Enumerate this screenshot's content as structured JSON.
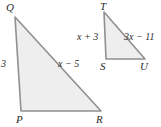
{
  "figure": {
    "background_color": "#ffffff",
    "shape_fill_color": "#eeeeee",
    "shape_stroke_color": "#909090",
    "text_color": "#2b2b2b",
    "triangles": [
      {
        "name": "triangle-QPR",
        "vertices": [
          {
            "label": "Q",
            "x": 15,
            "y": 17
          },
          {
            "label": "P",
            "x": 21,
            "y": 111
          },
          {
            "label": "R",
            "x": 101,
            "y": 111
          }
        ],
        "side_labels": [
          {
            "name": "side-QP",
            "text": "3"
          },
          {
            "name": "side-QR",
            "text": "x − 5"
          }
        ]
      },
      {
        "name": "triangle-TSU",
        "vertices": [
          {
            "label": "T",
            "x": 104,
            "y": 12
          },
          {
            "label": "S",
            "x": 106,
            "y": 59
          },
          {
            "label": "U",
            "x": 145,
            "y": 59
          }
        ],
        "side_labels": [
          {
            "name": "side-TS",
            "text": "x + 3"
          },
          {
            "name": "side-TU",
            "text": "3x − 11"
          }
        ]
      }
    ]
  }
}
